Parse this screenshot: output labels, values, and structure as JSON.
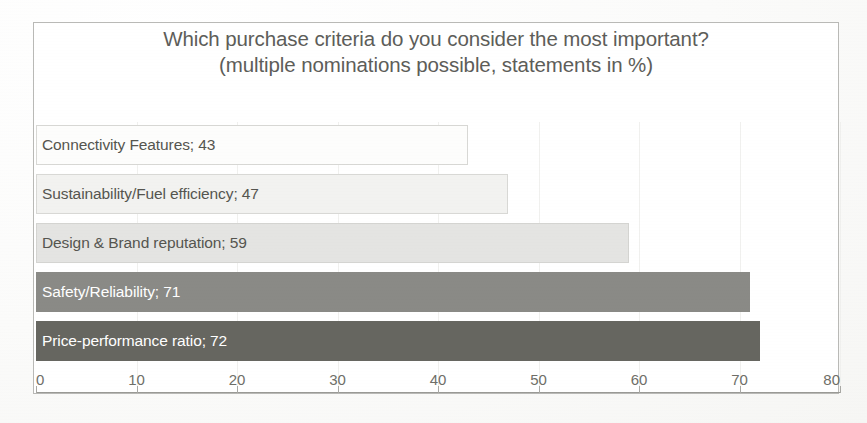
{
  "chart_data": {
    "type": "bar",
    "orientation": "horizontal",
    "title": "Which purchase criteria do you consider the most important?",
    "subtitle": "(multiple nominations possible, statements in %)",
    "title_line1": "Which purchase criteria do you consider the most important?",
    "title_line2": "(multiple nominations possible, statements in %)",
    "xlabel": "",
    "ylabel": "",
    "xlim": [
      0,
      80
    ],
    "grid": false,
    "legend": "none",
    "categories": [
      "Connectivity Features",
      "Sustainability/Fuel efficiency",
      "Design & Brand reputation",
      "Safety/Reliability",
      "Price-performance ratio"
    ],
    "values": [
      43,
      47,
      59,
      71,
      72
    ],
    "bar_labels": [
      "Connectivity Features; 43",
      "Sustainability/Fuel efficiency; 47",
      "Design & Brand reputation; 59",
      "Safety/Reliability; 71",
      "Price-performance ratio; 72"
    ],
    "bar_colors": [
      "#fdfdfc",
      "#f2f2f0",
      "#e4e4e2",
      "#8a8a86",
      "#666660"
    ],
    "bar_border_colors": [
      "#d8d8d5",
      "#d8d8d5",
      "#d4d4d1",
      "#8a8a86",
      "#666660"
    ],
    "label_text_colors": [
      "#55554f",
      "#55554f",
      "#55554f",
      "#ffffff",
      "#ffffff"
    ],
    "xticks": [
      0,
      10,
      20,
      30,
      40,
      50,
      60,
      70,
      80
    ],
    "xtick_labels": [
      "0",
      "10",
      "20",
      "30",
      "40",
      "50",
      "60",
      "70",
      "80"
    ]
  },
  "style": {
    "title_color": "#5d5d59",
    "axis_color": "#9a9a96",
    "frame_color": "#b9b9b6",
    "background": "#ffffff"
  }
}
